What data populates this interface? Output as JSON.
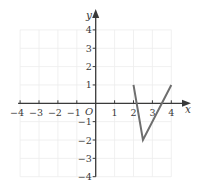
{
  "chart_data": {
    "type": "line",
    "title": "",
    "xlabel": "x",
    "ylabel": "y",
    "origin_label": "O",
    "xlim": [
      -4,
      4
    ],
    "ylim": [
      -4,
      4
    ],
    "grid": true,
    "x_ticks": [
      -4,
      -3,
      -2,
      -1,
      1,
      2,
      3,
      4
    ],
    "y_ticks": [
      4,
      3,
      2,
      1,
      -1,
      -2,
      -3,
      -4
    ],
    "x_tick_labels": [
      "−4",
      "−3",
      "−2",
      "−1",
      "1",
      "2",
      "3",
      "4"
    ],
    "y_tick_labels": [
      "4",
      "3",
      "2",
      "1",
      "−1",
      "−2",
      "−3",
      "−4"
    ],
    "series": [
      {
        "name": "graph",
        "points": [
          [
            2,
            1
          ],
          [
            2.5,
            -2
          ],
          [
            4,
            1
          ]
        ]
      }
    ],
    "legend": null
  },
  "colors": {
    "axis": "#3a3a3a",
    "grid": "#ececec",
    "curve": "#6e6e6e"
  }
}
